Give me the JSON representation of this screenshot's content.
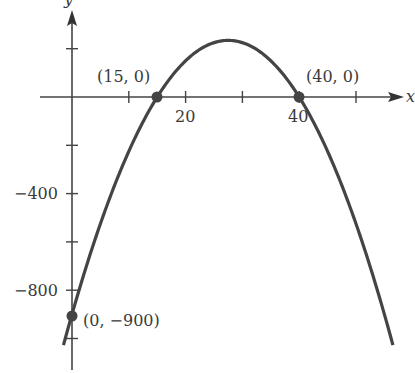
{
  "chart_data": {
    "type": "line",
    "title": "",
    "xlabel": "x",
    "ylabel": "y",
    "function": "y = -1.5(x - 15)(x - 40)",
    "xlim": [
      -5.5,
      58
    ],
    "ylim": [
      -1070,
      400
    ],
    "grid": false,
    "x_ticks": [
      10,
      20,
      30,
      40,
      50
    ],
    "x_tick_labels": [
      {
        "value": 20,
        "label": "20"
      },
      {
        "value": 40,
        "label": "40"
      }
    ],
    "y_ticks": [
      200,
      -200,
      -400,
      -600,
      -800,
      -1000
    ],
    "y_tick_labels": [
      {
        "value": -400,
        "label": "−400"
      },
      {
        "value": -800,
        "label": "−800"
      }
    ],
    "series": [
      {
        "name": "parabola",
        "color": "#444444",
        "x": [
          -1.5,
          0,
          5,
          10,
          15,
          20,
          25,
          27.5,
          30,
          35,
          40,
          45,
          50,
          56.5
        ],
        "y": [
          -1026,
          -900,
          -525,
          -225,
          0,
          150,
          225,
          234.4,
          225,
          150,
          0,
          -225,
          -525,
          -1026
        ]
      }
    ],
    "annotations": [
      {
        "point": [
          15,
          0
        ],
        "label": "(15, 0)"
      },
      {
        "point": [
          40,
          0
        ],
        "label": "(40, 0)"
      },
      {
        "point": [
          0,
          -900
        ],
        "label": "(0, −900)"
      }
    ]
  }
}
